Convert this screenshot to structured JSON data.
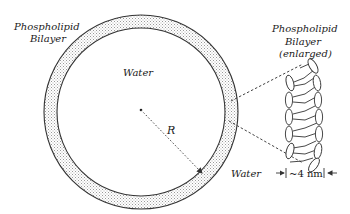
{
  "diagram": {
    "type": "liposome-vesicle-schematic",
    "labels": {
      "outer_bilayer_line1": "Phospholipid",
      "outer_bilayer_line2": "Bilayer",
      "inner_water": "Water",
      "outer_water": "Water",
      "radius": "R",
      "enlarged_line1": "Phospholipid",
      "enlarged_line2": "Bilayer",
      "enlarged_line3": "(enlarged)",
      "thickness": "~4 nm"
    },
    "vesicle": {
      "center": [
        141,
        112
      ],
      "outer_radius": 97,
      "inner_radius": 84,
      "fill_pattern": "stippled"
    },
    "colors": {
      "stroke": "#333333",
      "stipple": "#9a9a9a",
      "background": "#ffffff"
    }
  }
}
